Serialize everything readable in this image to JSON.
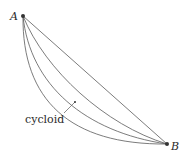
{
  "diagram": {
    "points": {
      "A": {
        "label": "A",
        "x": 23,
        "y": 16
      },
      "B": {
        "label": "B",
        "x": 167,
        "y": 144
      }
    },
    "curves": [
      {
        "name": "straight-line",
        "path": "M23,16 L167,144"
      },
      {
        "name": "curve-shallow",
        "path": "M23,16 C45,70 105,125 167,144"
      },
      {
        "name": "cycloid",
        "path": "M23,16 C30,85 85,132 167,144"
      },
      {
        "name": "curve-deep",
        "path": "M23,16 C22,100 70,145 167,144"
      }
    ],
    "annotation": {
      "label": "cycloid"
    },
    "colors": {
      "stroke": "#555555",
      "text": "#2a2a2a"
    }
  }
}
